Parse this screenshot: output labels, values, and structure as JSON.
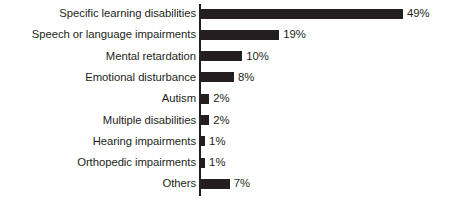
{
  "chart_data": {
    "type": "bar",
    "orientation": "horizontal",
    "title": "",
    "subtitle": "",
    "xlabel": "",
    "ylabel": "",
    "xlim": [
      0,
      49
    ],
    "grid": false,
    "legend": false,
    "value_suffix": "%",
    "categories": [
      "Specific learning disabilities",
      "Speech or language impairments",
      "Mental retardation",
      "Emotional disturbance",
      "Autism",
      "Multiple disabilities",
      "Hearing impairments",
      "Orthopedic impairments",
      "Others"
    ],
    "values": [
      49,
      19,
      10,
      8,
      2,
      2,
      1,
      1,
      7
    ],
    "value_labels": [
      "49%",
      "19%",
      "10%",
      "8%",
      "2%",
      "2%",
      "1%",
      "1%",
      "7%"
    ],
    "bar_color": "#231f20",
    "text_color": "#231f20",
    "background_color": "#ffffff",
    "axis_color": "#231f20"
  }
}
